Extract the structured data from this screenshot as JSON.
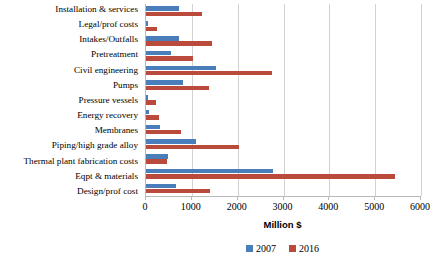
{
  "chart_data": {
    "type": "bar",
    "orientation": "horizontal",
    "title": "",
    "xlabel": "Million $",
    "ylabel": "",
    "xlim": [
      0,
      6000
    ],
    "xticks": [
      0,
      1000,
      2000,
      3000,
      4000,
      5000,
      6000
    ],
    "grid": true,
    "legend_position": "bottom",
    "categories": [
      "Installation & services",
      "Legal/prof costs",
      "Intakes/Outfalls",
      "Pretreatment",
      "Civil engineering",
      "Pumps",
      "Pressure vessels",
      "Energy recovery",
      "Membranes",
      "Piping/high grade alloy",
      "Thermal plant fabrication costs",
      "Eqpt & materials",
      "Design/prof cost"
    ],
    "series": [
      {
        "name": "2007",
        "color": "#4a7ebb",
        "values": [
          720,
          40,
          720,
          540,
          1520,
          810,
          50,
          60,
          300,
          1090,
          480,
          2760,
          650
        ]
      },
      {
        "name": "2016",
        "color": "#ba4a3c",
        "values": [
          1220,
          240,
          1440,
          1030,
          2750,
          1370,
          220,
          280,
          760,
          2030,
          460,
          5440,
          1390
        ]
      }
    ]
  }
}
